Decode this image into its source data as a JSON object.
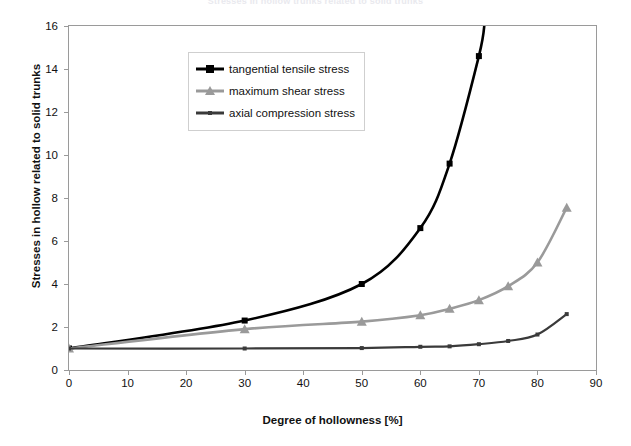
{
  "chart_title": "Stresses in hollow trunks related to solid trunks",
  "legend": {
    "items": [
      {
        "label": "tangential tensile stress",
        "marker": "square",
        "color": "#000000"
      },
      {
        "label": "maximum shear stress",
        "marker": "triangle",
        "color": "#9a9a9a"
      },
      {
        "label": "axial compression stress",
        "marker": "small-square",
        "color": "#3a3a3a"
      }
    ]
  },
  "chart_data": {
    "type": "line",
    "title": "Stresses in hollow trunks related to solid trunks",
    "xlabel": "Degree of hollowness [%]",
    "ylabel": "Stresses in hollow related to solid trunks",
    "xlim": [
      0,
      90
    ],
    "ylim": [
      0,
      16
    ],
    "xticks": [
      0,
      10,
      20,
      30,
      40,
      50,
      60,
      70,
      80,
      90
    ],
    "yticks": [
      0,
      2,
      4,
      6,
      8,
      10,
      12,
      14,
      16
    ],
    "grid": false,
    "legend_position": "upper-left-inside",
    "series": [
      {
        "name": "tangential tensile stress",
        "color": "#000000",
        "marker": "square",
        "x": [
          0,
          30,
          50,
          60,
          65,
          70,
          71
        ],
        "y": [
          1.0,
          2.3,
          4.0,
          6.6,
          9.6,
          14.6,
          16.2
        ]
      },
      {
        "name": "maximum shear stress",
        "color": "#9a9a9a",
        "marker": "triangle",
        "x": [
          0,
          30,
          50,
          60,
          65,
          70,
          75,
          80,
          85
        ],
        "y": [
          1.0,
          1.9,
          2.25,
          2.55,
          2.85,
          3.25,
          3.9,
          5.0,
          7.55
        ]
      },
      {
        "name": "axial compression stress",
        "color": "#3a3a3a",
        "marker": "small-square",
        "x": [
          0,
          30,
          50,
          60,
          65,
          70,
          75,
          80,
          85
        ],
        "y": [
          1.0,
          1.0,
          1.02,
          1.08,
          1.1,
          1.2,
          1.35,
          1.65,
          2.6
        ]
      }
    ]
  }
}
